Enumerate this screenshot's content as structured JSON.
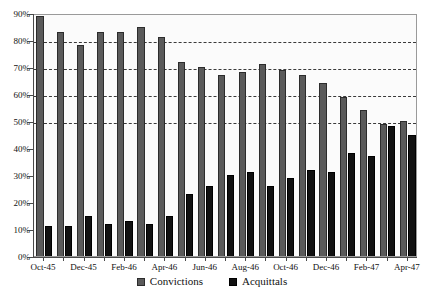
{
  "chart_data": {
    "type": "bar",
    "title": "",
    "xlabel": "",
    "ylabel": "",
    "ylim": [
      0,
      90
    ],
    "ytick_labels": [
      "0%",
      "10%",
      "20%",
      "30%",
      "40%",
      "50%",
      "60%",
      "70%",
      "80%",
      "90%"
    ],
    "ytick_values": [
      0,
      10,
      20,
      30,
      40,
      50,
      60,
      70,
      80,
      90
    ],
    "grid": true,
    "gridlines_at": [
      50,
      60,
      70,
      80
    ],
    "legend_position": "bottom",
    "categories": [
      "Oct-45",
      "Nov-45",
      "Dec-45",
      "Jan-46",
      "Feb-46",
      "Mar-46",
      "Apr-46",
      "May-46",
      "Jun-46",
      "Jul-46",
      "Aug-46",
      "Sep-46",
      "Oct-46",
      "Nov-46",
      "Dec-46",
      "Jan-47",
      "Feb-47",
      "Mar-47",
      "Apr-47"
    ],
    "tick_labels": [
      "Oct-45",
      "",
      "Dec-45",
      "",
      "Feb-46",
      "",
      "Apr-46",
      "",
      "Jun-46",
      "",
      "Aug-46",
      "",
      "Oct-46",
      "",
      "Dec-46",
      "",
      "Feb-47",
      "",
      "Apr-47"
    ],
    "series": [
      {
        "name": "Convictions",
        "color": "#5a5a5a",
        "values": [
          89,
          83,
          78,
          83,
          83,
          85,
          81,
          72,
          70,
          67,
          68,
          71,
          69,
          67,
          64,
          59,
          54,
          49,
          50
        ]
      },
      {
        "name": "Acquittals",
        "color": "#111111",
        "values": [
          11,
          11,
          15,
          12,
          13,
          12,
          15,
          23,
          26,
          30,
          31,
          26,
          29,
          32,
          31,
          38,
          37,
          48,
          45
        ]
      }
    ]
  },
  "legend": {
    "items": [
      {
        "label": "Convictions",
        "swatch": "legend-swatch-convictions"
      },
      {
        "label": "Acquittals",
        "swatch": "legend-swatch-acquittals"
      }
    ]
  }
}
